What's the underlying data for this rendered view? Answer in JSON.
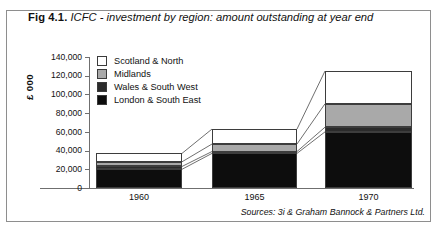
{
  "figure": {
    "number": "Fig 4.1.",
    "title": "ICFC - investment by region: amount outstanding at year end",
    "source": "Sources: 3i & Graham Bannock & Partners Ltd."
  },
  "chart_data": {
    "type": "bar",
    "subtype": "stacked",
    "title": "ICFC - investment by region: amount outstanding at year end",
    "xlabel": "",
    "ylabel": "£ 000",
    "categories": [
      "1960",
      "1965",
      "1970"
    ],
    "ylim": [
      0,
      140000
    ],
    "yticks": [
      0,
      20000,
      40000,
      60000,
      80000,
      100000,
      120000,
      140000
    ],
    "ytick_labels": [
      "0",
      "20,000",
      "40,000",
      "60,000",
      "80,000",
      "100,000",
      "120,000",
      "140,000"
    ],
    "grid": false,
    "legend_position": "upper-left-inside",
    "stack_order_bottom_to_top": [
      "London & South East",
      "Wales & South West",
      "Midlands",
      "Scotland & North"
    ],
    "series": [
      {
        "name": "London & South East",
        "color": "#0d0d0d",
        "values": [
          20000,
          37000,
          60000
        ]
      },
      {
        "name": "Wales & South West",
        "color": "#2b2b2b",
        "values": [
          3000,
          2000,
          5000
        ]
      },
      {
        "name": "Midlands",
        "color": "#a9a9a9",
        "values": [
          5000,
          8000,
          25000
        ]
      },
      {
        "name": "Scotland & North",
        "color": "#ffffff",
        "values": [
          9000,
          16000,
          35000
        ]
      }
    ],
    "totals": [
      37000,
      63000,
      125000
    ]
  },
  "legend": {
    "items": [
      {
        "label": "Scotland & North",
        "color": "#ffffff"
      },
      {
        "label": "Midlands",
        "color": "#a9a9a9"
      },
      {
        "label": "Wales & South West",
        "color": "#2b2b2b"
      },
      {
        "label": "London & South East",
        "color": "#0d0d0d"
      }
    ]
  }
}
